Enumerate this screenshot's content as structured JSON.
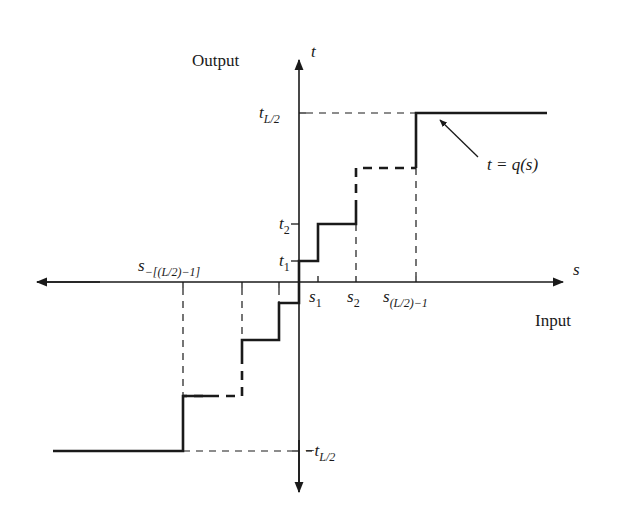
{
  "figure": {
    "type": "quantizer-staircase",
    "colors": {
      "ink": "#1a1a1a",
      "background": "#ffffff"
    }
  },
  "axes": {
    "vertical": {
      "name": "t",
      "title": "Output"
    },
    "horizontal": {
      "name": "s",
      "title": "Input"
    }
  },
  "labels": {
    "t_top": {
      "base": "t",
      "sub": "L/2"
    },
    "t2": {
      "base": "t",
      "sub": "2"
    },
    "t1": {
      "base": "t",
      "sub": "1"
    },
    "t_bottom": {
      "prefix": "−",
      "base": "t",
      "sub": "L/2"
    },
    "s1": {
      "base": "s",
      "sub": "1"
    },
    "s2": {
      "base": "s",
      "sub": "2"
    },
    "s_last": {
      "base": "s",
      "sub": "(L/2)−1"
    },
    "s_neg": {
      "base": "s",
      "sub": "−[(L/2)−1]"
    },
    "function": "t = q(s)"
  },
  "geometry": {
    "origin": [
      299,
      282
    ],
    "t_axis": {
      "x": 299,
      "y_top": 58,
      "y_bottom": 492
    },
    "s_axis": {
      "y": 282,
      "x_left": 35,
      "x_right": 563
    },
    "t_levels_y": {
      "t_top": 113,
      "t2": 224,
      "t1": 261,
      "t_bottom": 451
    },
    "s_positions_x": {
      "s1": 318,
      "s2": 356,
      "s_last": 416,
      "neg1": 279,
      "neg2": 242,
      "s_neg": 183
    }
  }
}
